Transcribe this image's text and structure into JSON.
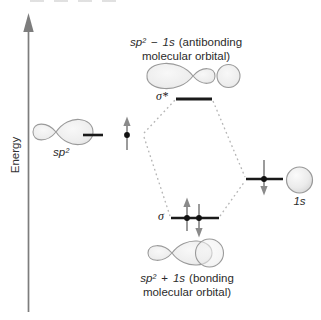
{
  "diagram": {
    "axis": {
      "label": "Energy"
    },
    "left_orbital": {
      "label": "sp²"
    },
    "right_orbital": {
      "label": "1s"
    },
    "antibonding": {
      "level_label": "σ*",
      "caption_f1": "sp²",
      "caption_op": "−",
      "caption_f2": "1s",
      "caption_rest": "(antibonding",
      "caption_line2": "molecular orbital)"
    },
    "bonding": {
      "level_label": "σ",
      "caption_f1": "sp²",
      "caption_op": "+",
      "caption_f2": "1s",
      "caption_rest": "(bonding",
      "caption_line2": "molecular orbital)"
    },
    "electrons": {
      "sp2_level": "one spin-up electron",
      "sigma_level": "paired spin-up and spin-down electrons",
      "one_s_level": "one spin-down electron",
      "sigma_star_level": "empty"
    },
    "colors": {
      "level_line": "#1a1a1a",
      "electron_arrow": "#8a8a8a",
      "dashed_guide": "#b5b5b5",
      "orbital_outline": "#9a9a9a",
      "orbital_fill": "#ededed",
      "axis": "#7d7d7d",
      "text": "#2b2b2b",
      "background": "#ffffff"
    }
  }
}
